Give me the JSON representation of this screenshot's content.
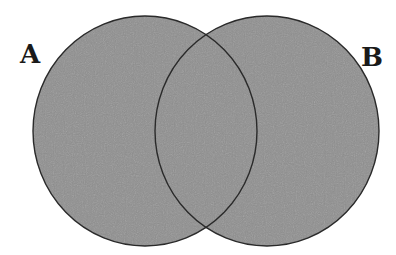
{
  "diagram": {
    "type": "venn",
    "sets": [
      {
        "label": "A",
        "cx": 145,
        "cy": 131,
        "rx": 112,
        "ry": 115
      },
      {
        "label": "B",
        "cx": 267,
        "cy": 131,
        "rx": 112,
        "ry": 115
      }
    ],
    "fill_color": "#8f8f8f",
    "stroke_color": "#2a2a2a",
    "label_color": "#1a1a1a"
  }
}
